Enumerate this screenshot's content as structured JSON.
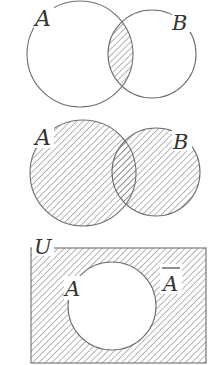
{
  "colors": {
    "stroke": "#6e6e6e",
    "hatch": "#7a7a7a",
    "label": "#333333",
    "background": "#ffffff"
  },
  "diagrams": [
    {
      "name": "intersection",
      "description": "A ∩ B shaded",
      "labels": {
        "a": "A",
        "b": "B"
      }
    },
    {
      "name": "union",
      "description": "A ∪ B shaded",
      "labels": {
        "a": "A",
        "b": "B"
      }
    },
    {
      "name": "complement",
      "description": "Complement of A in U shaded",
      "labels": {
        "universe": "U",
        "a": "A",
        "a_complement": "A"
      }
    }
  ]
}
